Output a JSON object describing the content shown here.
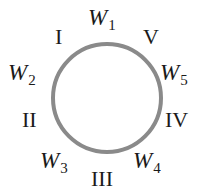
{
  "diagram": {
    "type": "ring",
    "circle": {
      "cx": 107,
      "cy": 98,
      "r": 54,
      "stroke": "#8a8a8a",
      "stroke_width": 4
    },
    "w_labels": [
      {
        "id": "w1",
        "base": "W",
        "sub": "1",
        "x": 88,
        "y": 25
      },
      {
        "id": "w2",
        "base": "W",
        "sub": "2",
        "x": 8,
        "y": 80
      },
      {
        "id": "w3",
        "base": "W",
        "sub": "3",
        "x": 40,
        "y": 168
      },
      {
        "id": "w4",
        "base": "W",
        "sub": "4",
        "x": 133,
        "y": 168
      },
      {
        "id": "w5",
        "base": "W",
        "sub": "5",
        "x": 160,
        "y": 80
      }
    ],
    "roman_labels": [
      {
        "id": "I",
        "text": "I",
        "x": 55,
        "y": 44
      },
      {
        "id": "II",
        "text": "II",
        "x": 22,
        "y": 127
      },
      {
        "id": "III",
        "text": "III",
        "x": 91,
        "y": 186
      },
      {
        "id": "IV",
        "text": "IV",
        "x": 165,
        "y": 127
      },
      {
        "id": "V",
        "text": "V",
        "x": 143,
        "y": 44
      }
    ]
  }
}
